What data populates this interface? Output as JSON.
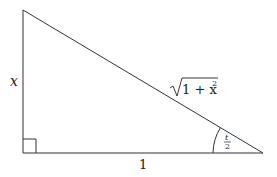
{
  "diagram": {
    "type": "right-triangle",
    "labels": {
      "vertical_side": "x",
      "horizontal_side": "1",
      "hypotenuse_radical": "1 + x",
      "hypotenuse_exponent": "2",
      "angle_numerator": "t",
      "angle_denominator": "2"
    },
    "stroke_color": "#333333",
    "background": "#ffffff"
  }
}
